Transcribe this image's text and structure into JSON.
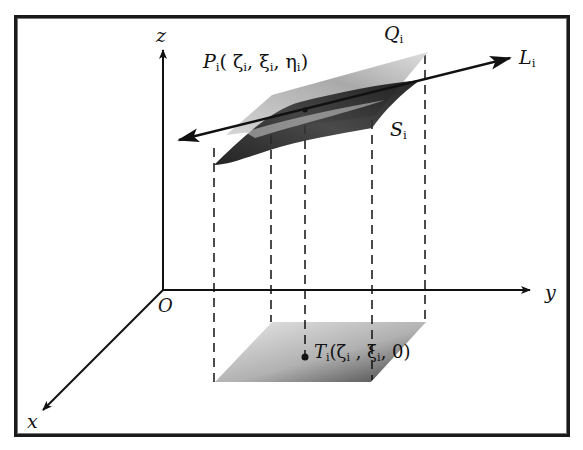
{
  "diagram": {
    "type": "3d-coordinate-surface-projection",
    "axes": {
      "x": {
        "label": "x"
      },
      "y": {
        "label": "y"
      },
      "z": {
        "label": "z"
      },
      "origin": {
        "label": "O"
      }
    },
    "labels": {
      "P_name": "P",
      "P_sub": "i",
      "P_coords": "( ζ",
      "P_c1_sub": "i",
      "P_c2": ", ξ",
      "P_c2_sub": "i",
      "P_c3": ", η",
      "P_c3_sub": "i",
      "P_close": ")",
      "Q_name": "Q",
      "Q_sub": "i",
      "L_name": "L",
      "L_sub": "i",
      "S_name": "S",
      "S_sub": "i",
      "T_name": "T",
      "T_sub": "i",
      "T_coords": "(ζ",
      "T_c1_sub": "i",
      "T_c2": " , ξ",
      "T_c2_sub": "i",
      "T_c3": ", 0)"
    },
    "colors": {
      "ink": "#111111",
      "surface_dark": "#1e1e1e",
      "surface_light": "#9a9a9a",
      "projection": "#b5b5b5"
    }
  }
}
